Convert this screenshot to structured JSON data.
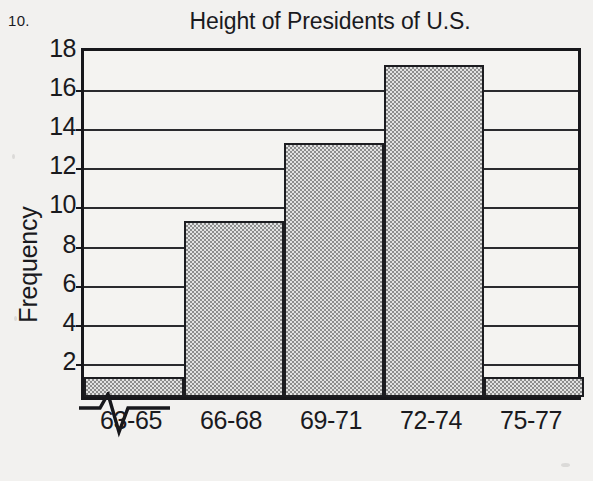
{
  "problem": {
    "number": "10."
  },
  "chart_data": {
    "type": "bar",
    "title": "Height of Presidents of U.S.",
    "xlabel": "Height (in.)",
    "ylabel": "Frequency",
    "categories": [
      "63-65",
      "66-68",
      "69-71",
      "72-74",
      "75-77"
    ],
    "values": [
      1,
      9,
      13,
      17,
      1
    ],
    "ylim": [
      0,
      18
    ],
    "ytick_labels": [
      "2",
      "4",
      "6",
      "8",
      "10",
      "12",
      "14",
      "16",
      "18"
    ],
    "ytick_values": [
      2,
      4,
      6,
      8,
      10,
      12,
      14,
      16,
      18
    ],
    "ytick_step": 2,
    "grid": true,
    "legend": "none",
    "axis_break": true,
    "axis_break_note": "zigzag break on horizontal axis before first bar",
    "bar_fill": "#b9b9b9",
    "bar_edge": "#1c1c20",
    "background": "#f2f1ef",
    "axis_color": "#17171b"
  }
}
